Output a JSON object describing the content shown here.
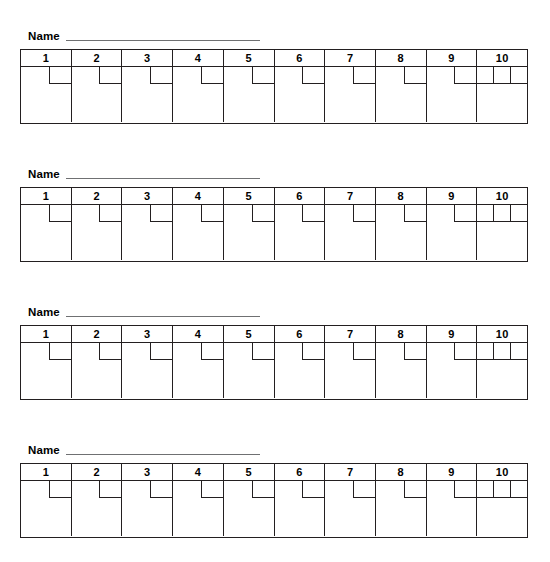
{
  "page": {
    "clipped_header_text": "",
    "background_color": "#ffffff",
    "ink_color": "#231f20",
    "rule_color": "#6f7072"
  },
  "blocks": [
    {
      "name_label": "Name",
      "name_value": "",
      "top": 26,
      "columns": [
        {
          "header": "1",
          "mark": "notch"
        },
        {
          "header": "2",
          "mark": "notch"
        },
        {
          "header": "3",
          "mark": "notch"
        },
        {
          "header": "4",
          "mark": "notch"
        },
        {
          "header": "5",
          "mark": "notch"
        },
        {
          "header": "6",
          "mark": "notch"
        },
        {
          "header": "7",
          "mark": "notch"
        },
        {
          "header": "8",
          "mark": "notch"
        },
        {
          "header": "9",
          "mark": "notch"
        },
        {
          "header": "10",
          "mark": "triple"
        }
      ]
    },
    {
      "name_label": "Name",
      "name_value": "",
      "top": 164,
      "columns": [
        {
          "header": "1",
          "mark": "notch"
        },
        {
          "header": "2",
          "mark": "notch"
        },
        {
          "header": "3",
          "mark": "notch"
        },
        {
          "header": "4",
          "mark": "notch"
        },
        {
          "header": "5",
          "mark": "notch"
        },
        {
          "header": "6",
          "mark": "notch"
        },
        {
          "header": "7",
          "mark": "notch"
        },
        {
          "header": "8",
          "mark": "notch"
        },
        {
          "header": "9",
          "mark": "notch"
        },
        {
          "header": "10",
          "mark": "triple"
        }
      ]
    },
    {
      "name_label": "Name",
      "name_value": "",
      "top": 302,
      "columns": [
        {
          "header": "1",
          "mark": "notch"
        },
        {
          "header": "2",
          "mark": "notch"
        },
        {
          "header": "3",
          "mark": "notch"
        },
        {
          "header": "4",
          "mark": "notch"
        },
        {
          "header": "5",
          "mark": "notch"
        },
        {
          "header": "6",
          "mark": "notch"
        },
        {
          "header": "7",
          "mark": "notch"
        },
        {
          "header": "8",
          "mark": "notch"
        },
        {
          "header": "9",
          "mark": "notch"
        },
        {
          "header": "10",
          "mark": "triple"
        }
      ]
    },
    {
      "name_label": "Name",
      "name_value": "",
      "top": 440,
      "columns": [
        {
          "header": "1",
          "mark": "notch"
        },
        {
          "header": "2",
          "mark": "notch"
        },
        {
          "header": "3",
          "mark": "notch"
        },
        {
          "header": "4",
          "mark": "notch"
        },
        {
          "header": "5",
          "mark": "notch"
        },
        {
          "header": "6",
          "mark": "notch"
        },
        {
          "header": "7",
          "mark": "notch"
        },
        {
          "header": "8",
          "mark": "notch"
        },
        {
          "header": "9",
          "mark": "notch"
        },
        {
          "header": "10",
          "mark": "triple"
        }
      ]
    }
  ]
}
